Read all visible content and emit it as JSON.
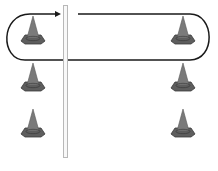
{
  "diagram": {
    "colors": {
      "cone_fill": "#7a7a7a",
      "cone_base": "#5e5e5e",
      "cone_outline": "#3a3a3a",
      "path": "#1a1a1a",
      "pole": "#b8b8b8",
      "background": "#ffffff"
    },
    "cones": [
      {
        "column": "left",
        "row": 1,
        "x": 20,
        "y": 16
      },
      {
        "column": "left",
        "row": 2,
        "x": 20,
        "y": 63
      },
      {
        "column": "left",
        "row": 3,
        "x": 20,
        "y": 109
      },
      {
        "column": "right",
        "row": 1,
        "x": 170,
        "y": 16
      },
      {
        "column": "right",
        "row": 2,
        "x": 170,
        "y": 63
      },
      {
        "column": "right",
        "row": 3,
        "x": 170,
        "y": 109
      }
    ],
    "pole": {
      "x": 63,
      "y_top": 5,
      "y_bottom": 158
    },
    "path": {
      "shape": "loop",
      "direction": "arrow pointing right into pole at top-left",
      "has_gap_at_pole_top": true
    }
  }
}
